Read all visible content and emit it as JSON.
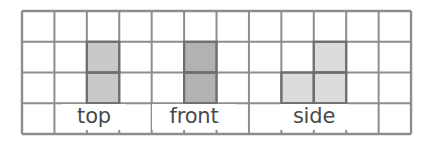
{
  "figure": {
    "background_color": "#ffffff"
  },
  "grid": {
    "columns": 12,
    "rows": 4,
    "origin_x": 22,
    "origin_y": 11,
    "cell_width": 32.42,
    "cell_height": 30.75,
    "line_color": "#8d8d8d",
    "line_width": 2,
    "outer_line_color": "#8d8d8d",
    "outer_line_width": 2.4
  },
  "shapes": [
    {
      "name": "top",
      "shape_type": "vertical-domino",
      "fill": "#c9c9c9",
      "stroke": "#6e6e6e",
      "stroke_width": 2.2,
      "cells": [
        {
          "col": 2,
          "row": 1
        },
        {
          "col": 2,
          "row": 2
        }
      ]
    },
    {
      "name": "front",
      "shape_type": "vertical-domino",
      "fill": "#b2b2b2",
      "stroke": "#6e6e6e",
      "stroke_width": 2.2,
      "cells": [
        {
          "col": 5,
          "row": 1
        },
        {
          "col": 5,
          "row": 2
        }
      ]
    },
    {
      "name": "side",
      "shape_type": "l-tromino",
      "fill": "#dcdcdc",
      "stroke": "#6e6e6e",
      "stroke_width": 2.2,
      "cells": [
        {
          "col": 9,
          "row": 1
        },
        {
          "col": 8,
          "row": 2
        },
        {
          "col": 9,
          "row": 2
        }
      ]
    }
  ],
  "labels": [
    {
      "text": "top",
      "center_col": 2.5,
      "row": 3,
      "left": 62,
      "top": 104,
      "width": 58,
      "font_size": 21,
      "color": "#4a4a4a"
    },
    {
      "text": "front",
      "center_col": 5.5,
      "row": 3,
      "left": 152,
      "top": 104,
      "width": 78,
      "font_size": 21,
      "color": "#4a4a4a"
    },
    {
      "text": "side",
      "center_col": 9.0,
      "row": 3,
      "left": 280,
      "top": 104,
      "width": 62,
      "font_size": 21,
      "color": "#4a4a4a"
    }
  ]
}
